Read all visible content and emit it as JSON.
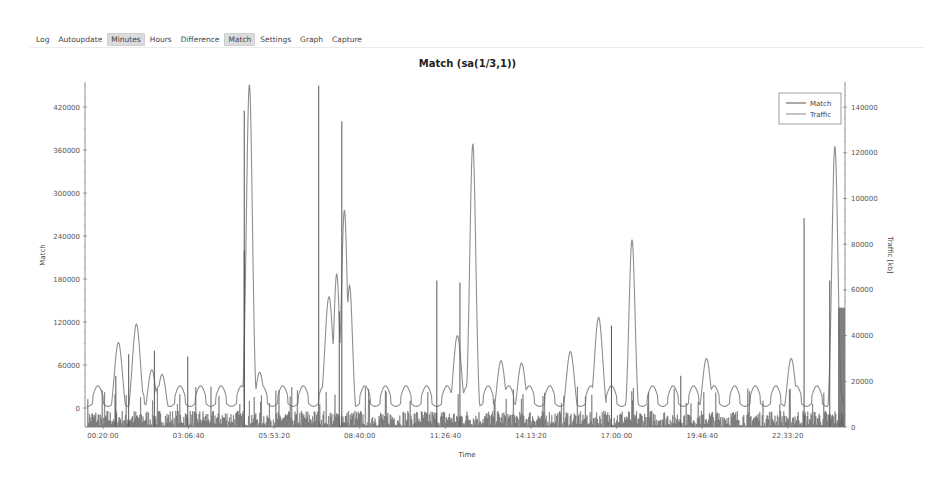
{
  "menu": {
    "items": [
      {
        "label": "Log",
        "active": false
      },
      {
        "label": "Autoupdate",
        "active": false
      },
      {
        "label": "Minutes",
        "active": true
      },
      {
        "label": "Hours",
        "active": false
      },
      {
        "label": "Difference",
        "active": false
      },
      {
        "label": "Match",
        "active": true
      },
      {
        "label": "Settings",
        "active": false
      },
      {
        "label": "Graph",
        "active": false
      },
      {
        "label": "Capture",
        "active": false
      }
    ]
  },
  "chart": {
    "title": "Match (sa(1/3,1))",
    "xlabel": "Time",
    "ylabel_left": "Match",
    "ylabel_right": "Traffic [kb]",
    "legend": [
      {
        "label": "Match",
        "color": "#555555"
      },
      {
        "label": "Traffic",
        "color": "#8a8a8a"
      }
    ]
  },
  "chart_data": {
    "type": "line",
    "title": "Match (sa(1/3,1))",
    "xlabel": "Time",
    "ylabel": "Match",
    "y2label": "Traffic [kb]",
    "x_ticks": [
      "00:20:00",
      "03:06:40",
      "05:53:20",
      "08:40:00",
      "11:26:40",
      "14:13:20",
      "17:00:00",
      "19:46:40",
      "22:33:20"
    ],
    "y_ticks": [
      0,
      60000,
      120000,
      180000,
      240000,
      300000,
      360000,
      420000
    ],
    "y2_ticks": [
      0,
      20000,
      40000,
      60000,
      80000,
      100000,
      120000,
      140000
    ],
    "ylim": [
      -26500,
      455000
    ],
    "y2lim": [
      0,
      151000
    ],
    "grid": false,
    "legend_position": "upper right",
    "series": [
      {
        "name": "Match",
        "axis": "left",
        "note": "dense spiky series; notable peaks (time, value)",
        "peaks": [
          {
            "x": "00:45",
            "y": 45000
          },
          {
            "x": "01:10",
            "y": 75000
          },
          {
            "x": "02:00",
            "y": 80000
          },
          {
            "x": "03:05",
            "y": 72000
          },
          {
            "x": "04:55",
            "y": 415000
          },
          {
            "x": "04:55",
            "y": 220000
          },
          {
            "x": "07:20",
            "y": 450000
          },
          {
            "x": "08:05",
            "y": 400000
          },
          {
            "x": "08:00",
            "y": 135000
          },
          {
            "x": "11:10",
            "y": 178000
          },
          {
            "x": "11:55",
            "y": 175000
          },
          {
            "x": "16:50",
            "y": 115000
          },
          {
            "x": "19:05",
            "y": 45000
          },
          {
            "x": "23:05",
            "y": 265000
          },
          {
            "x": "23:55",
            "y": 178000
          }
        ]
      },
      {
        "name": "Traffic",
        "axis": "right",
        "note": "periodic oscillating series with large peaks (time, kb)",
        "peaks": [
          {
            "x": "00:50",
            "y": 37000
          },
          {
            "x": "01:25",
            "y": 45000
          },
          {
            "x": "01:55",
            "y": 25000
          },
          {
            "x": "02:15",
            "y": 23000
          },
          {
            "x": "05:05",
            "y": 150000
          },
          {
            "x": "05:25",
            "y": 24000
          },
          {
            "x": "07:40",
            "y": 57000
          },
          {
            "x": "07:55",
            "y": 67000
          },
          {
            "x": "08:10",
            "y": 95000
          },
          {
            "x": "08:20",
            "y": 62000
          },
          {
            "x": "11:50",
            "y": 40000
          },
          {
            "x": "12:20",
            "y": 124000
          },
          {
            "x": "13:15",
            "y": 29000
          },
          {
            "x": "13:55",
            "y": 28000
          },
          {
            "x": "15:30",
            "y": 33000
          },
          {
            "x": "16:25",
            "y": 48000
          },
          {
            "x": "17:30",
            "y": 82000
          },
          {
            "x": "19:55",
            "y": 30000
          },
          {
            "x": "22:40",
            "y": 30000
          },
          {
            "x": "24:05",
            "y": 123000
          }
        ],
        "baseline_oscillation": {
          "min": 7000,
          "max": 16000,
          "period_minutes": 40
        }
      }
    ]
  }
}
